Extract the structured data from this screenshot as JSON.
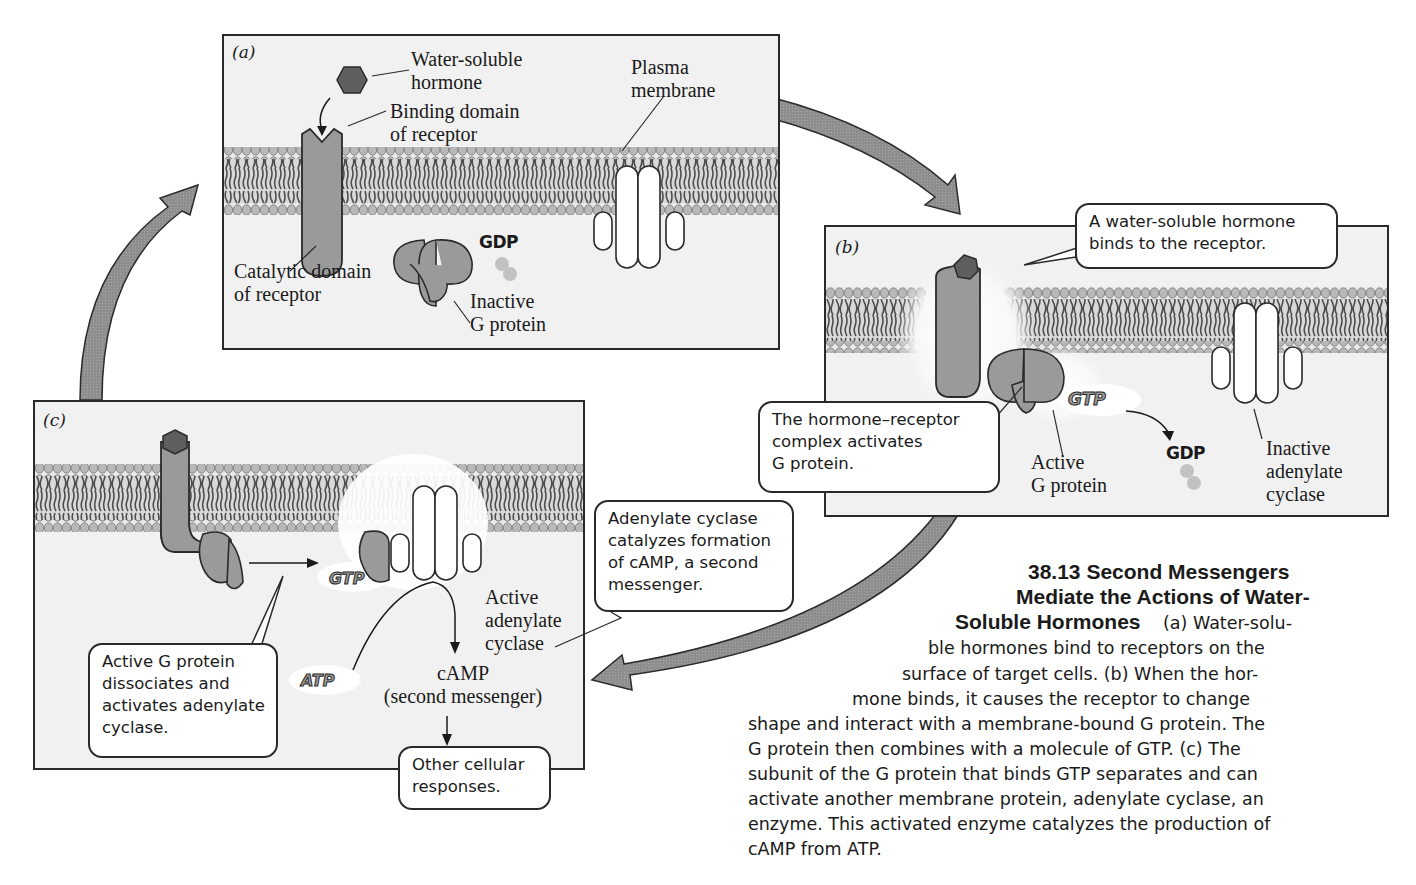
{
  "figure": {
    "number": "38.13",
    "title_lines": [
      "38.13  Second Messengers",
      "Mediate the Actions of Water-",
      "Soluble Hormones"
    ],
    "caption_lines": [
      "(a) Water-solu-",
      "ble hormones bind to receptors on the",
      "surface of target cells. (b) When the hor-",
      "mone binds, it causes the receptor to change",
      "shape and interact with a membrane-bound G protein. The",
      "G protein then combines with a molecule of GTP. (c) The",
      "subunit of the G protein that binds GTP separates and can",
      "activate another membrane protein, adenylate cyclase, an",
      "enzyme. This activated enzyme catalyzes the production of",
      "cAMP from ATP."
    ]
  },
  "panels": {
    "a": {
      "label": "(a)",
      "labels": {
        "hormone": [
          "Water-soluble",
          "hormone"
        ],
        "binding_domain": [
          "Binding domain",
          "of receptor"
        ],
        "plasma_membrane": [
          "Plasma",
          "membrane"
        ],
        "catalytic_domain": [
          "Catalytic domain",
          "of receptor"
        ],
        "inactive_g_protein": [
          "Inactive",
          "G protein"
        ],
        "gdp": "GDP"
      }
    },
    "b": {
      "label": "(b)",
      "callout_top": [
        "A water-soluble hormone",
        "binds to the receptor."
      ],
      "callout_left": [
        "The hormone–receptor",
        "complex activates",
        "G protein."
      ],
      "labels": {
        "gtp": "GTP",
        "gdp": "GDP",
        "active_g_protein": [
          "Active",
          "G protein"
        ],
        "inactive_adenylate_cyclase": [
          "Inactive",
          "adenylate",
          "cyclase"
        ]
      }
    },
    "c": {
      "label": "(c)",
      "callout_left": [
        "Active G protein",
        "dissociates and",
        "activates adenylate",
        "cyclase."
      ],
      "callout_right": [
        "Adenylate cyclase",
        "catalyzes formation",
        "of cAMP, a second",
        "messenger."
      ],
      "callout_bottom": [
        "Other cellular",
        "responses."
      ],
      "labels": {
        "gtp": "GTP",
        "atp": "ATP",
        "active_adenylate_cyclase": [
          "Active",
          "adenylate",
          "cyclase"
        ],
        "camp": [
          "cAMP",
          "(second messenger)"
        ]
      }
    }
  },
  "colors": {
    "protein_fill": "#9a9a9a",
    "hormone_fill": "#5e5e5e",
    "membrane_head": "#b8b8b8",
    "membrane_tail": "#555555",
    "panel_bg": "#f1f1f1",
    "arrow_fill": "#8e8e8e",
    "outline": "#2a2a2a"
  }
}
